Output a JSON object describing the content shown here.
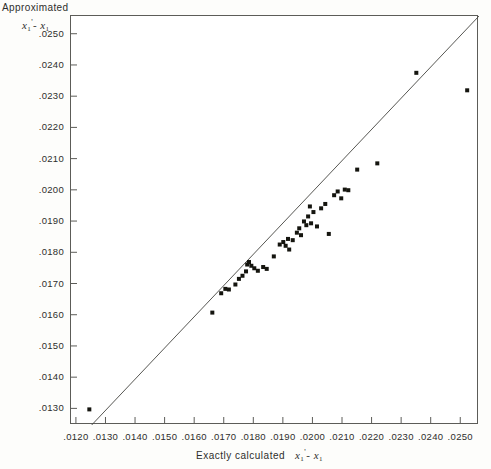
{
  "chart_data": {
    "type": "scatter",
    "title": "",
    "xlabel": "Exactly calculated  x₁' - x₁",
    "ylabel": "Approximated  x₁' - x₁",
    "ylabel_line1": "Approximated",
    "ylabel_line2": "x₁' - x₁",
    "xlabel_prefix": "Exactly  calculated",
    "xlim": [
      0.0118,
      0.0256
    ],
    "ylim": [
      0.0125,
      0.0256
    ],
    "grid": false,
    "legend": null,
    "xticks": [
      0.012,
      0.013,
      0.014,
      0.015,
      0.016,
      0.017,
      0.018,
      0.019,
      0.02,
      0.021,
      0.022,
      0.023,
      0.024,
      0.025
    ],
    "xtick_labels": [
      ".0120",
      ".0130",
      ".0140",
      ".0150",
      ".0160",
      ".0170",
      ".0180",
      ".0190",
      ".0200",
      ".0210",
      ".0220",
      ".0230",
      ".0240",
      ".0250"
    ],
    "yticks": [
      0.013,
      0.014,
      0.015,
      0.016,
      0.017,
      0.018,
      0.019,
      0.02,
      0.021,
      0.022,
      0.023,
      0.024,
      0.025
    ],
    "ytick_labels": [
      ".0130",
      ".0140",
      ".0150",
      ".0160",
      ".0170",
      ".0180",
      ".0190",
      ".0200",
      ".0210",
      ".0220",
      ".0230",
      ".0240",
      ".0250"
    ],
    "reference_line": {
      "name": "identity-line",
      "description": "y = x diagonal reference line",
      "x": [
        0.0118,
        0.0256
      ],
      "y": [
        0.0118,
        0.0256
      ],
      "color": "#444440"
    },
    "marker": {
      "shape": "square",
      "size_px": 4,
      "color": "#15150f"
    },
    "points": [
      {
        "x": 0.01242,
        "y": 0.013
      },
      {
        "x": 0.01658,
        "y": 0.0161
      },
      {
        "x": 0.01688,
        "y": 0.01672
      },
      {
        "x": 0.01702,
        "y": 0.01686
      },
      {
        "x": 0.01714,
        "y": 0.01684
      },
      {
        "x": 0.01736,
        "y": 0.017
      },
      {
        "x": 0.01748,
        "y": 0.01718
      },
      {
        "x": 0.0176,
        "y": 0.01728
      },
      {
        "x": 0.01772,
        "y": 0.01742
      },
      {
        "x": 0.01776,
        "y": 0.01764
      },
      {
        "x": 0.01782,
        "y": 0.01772
      },
      {
        "x": 0.0179,
        "y": 0.0176
      },
      {
        "x": 0.018,
        "y": 0.01752
      },
      {
        "x": 0.01812,
        "y": 0.01744
      },
      {
        "x": 0.0183,
        "y": 0.01756
      },
      {
        "x": 0.01842,
        "y": 0.0175
      },
      {
        "x": 0.01866,
        "y": 0.0179
      },
      {
        "x": 0.01886,
        "y": 0.01828
      },
      {
        "x": 0.01898,
        "y": 0.01836
      },
      {
        "x": 0.01906,
        "y": 0.01824
      },
      {
        "x": 0.01914,
        "y": 0.01846
      },
      {
        "x": 0.01918,
        "y": 0.01812
      },
      {
        "x": 0.0193,
        "y": 0.01842
      },
      {
        "x": 0.01944,
        "y": 0.01866
      },
      {
        "x": 0.01952,
        "y": 0.0188
      },
      {
        "x": 0.01958,
        "y": 0.01858
      },
      {
        "x": 0.01968,
        "y": 0.01902
      },
      {
        "x": 0.01976,
        "y": 0.0189
      },
      {
        "x": 0.01982,
        "y": 0.01918
      },
      {
        "x": 0.01988,
        "y": 0.0195
      },
      {
        "x": 0.01992,
        "y": 0.01896
      },
      {
        "x": 0.02,
        "y": 0.01932
      },
      {
        "x": 0.02012,
        "y": 0.01886
      },
      {
        "x": 0.02026,
        "y": 0.01944
      },
      {
        "x": 0.0204,
        "y": 0.01958
      },
      {
        "x": 0.02052,
        "y": 0.01862
      },
      {
        "x": 0.0207,
        "y": 0.01986
      },
      {
        "x": 0.02082,
        "y": 0.01998
      },
      {
        "x": 0.02094,
        "y": 0.01976
      },
      {
        "x": 0.02106,
        "y": 0.02004
      },
      {
        "x": 0.02118,
        "y": 0.02002
      },
      {
        "x": 0.02148,
        "y": 0.02068
      },
      {
        "x": 0.02216,
        "y": 0.02088
      },
      {
        "x": 0.02348,
        "y": 0.02378
      },
      {
        "x": 0.0252,
        "y": 0.02322
      }
    ]
  }
}
